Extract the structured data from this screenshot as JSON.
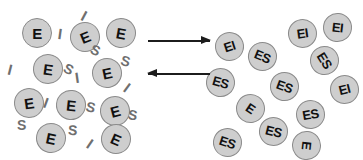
{
  "figure": {
    "background_color": "#ffffff",
    "token_fill_color": "#cecece",
    "token_border_color": "#8a8a8a",
    "token_text_color": "#111111",
    "glyph_color": "#6f6f6f",
    "arrow_color": "#1c1c1c"
  },
  "left_panel": {
    "name": "free-enzyme-pool",
    "tokens": [
      {
        "label": "E",
        "x": 22,
        "y": 18,
        "size": 30,
        "rotation": 0
      },
      {
        "label": "E",
        "x": 70,
        "y": 22,
        "size": 30,
        "rotation": -22
      },
      {
        "label": "E",
        "x": 106,
        "y": 18,
        "size": 30,
        "rotation": 10
      },
      {
        "label": "E",
        "x": 33,
        "y": 54,
        "size": 30,
        "rotation": 8
      },
      {
        "label": "E",
        "x": 92,
        "y": 58,
        "size": 30,
        "rotation": -12
      },
      {
        "label": "E",
        "x": 14,
        "y": 88,
        "size": 30,
        "rotation": -8
      },
      {
        "label": "E",
        "x": 56,
        "y": 90,
        "size": 30,
        "rotation": 6
      },
      {
        "label": "E",
        "x": 100,
        "y": 96,
        "size": 30,
        "rotation": -15
      },
      {
        "label": "E",
        "x": 36,
        "y": 123,
        "size": 30,
        "rotation": 12
      },
      {
        "label": "E",
        "x": 101,
        "y": 124,
        "size": 30,
        "rotation": 24
      }
    ],
    "glyphs": [
      {
        "label": "I",
        "x": 58,
        "y": 26,
        "rotation": 8
      },
      {
        "label": "I",
        "x": 82,
        "y": 8,
        "rotation": 28
      },
      {
        "label": "S",
        "x": 91,
        "y": 43,
        "rotation": 24
      },
      {
        "label": "S",
        "x": 121,
        "y": 54,
        "rotation": 16
      },
      {
        "label": "I",
        "x": 8,
        "y": 62,
        "rotation": 14
      },
      {
        "label": "S",
        "x": 64,
        "y": 62,
        "rotation": 28
      },
      {
        "label": "I",
        "x": 75,
        "y": 70,
        "rotation": -8
      },
      {
        "label": "I",
        "x": 125,
        "y": 80,
        "rotation": 36
      },
      {
        "label": "I",
        "x": 44,
        "y": 95,
        "rotation": 20
      },
      {
        "label": "S",
        "x": 86,
        "y": 100,
        "rotation": 14
      },
      {
        "label": "S",
        "x": 128,
        "y": 108,
        "rotation": 10
      },
      {
        "label": "S",
        "x": 17,
        "y": 118,
        "rotation": 0
      },
      {
        "label": "S",
        "x": 68,
        "y": 123,
        "rotation": 4
      },
      {
        "label": "I",
        "x": 88,
        "y": 136,
        "rotation": 34
      }
    ]
  },
  "arrows": [
    {
      "name": "forward-arrow",
      "direction": "right",
      "x": 148,
      "y": 40,
      "width": 62,
      "label": ""
    },
    {
      "name": "reverse-arrow",
      "direction": "left",
      "x": 148,
      "y": 73,
      "width": 62,
      "label": ""
    }
  ],
  "right_panel": {
    "name": "bound-complex-pool",
    "tokens": [
      {
        "label": "EI",
        "x": 215,
        "y": 32,
        "size": 29,
        "rotation": -18
      },
      {
        "label": "ES",
        "x": 248,
        "y": 42,
        "size": 29,
        "rotation": 22
      },
      {
        "label": "EI",
        "x": 288,
        "y": 19,
        "size": 29,
        "rotation": -8
      },
      {
        "label": "EI",
        "x": 323,
        "y": 13,
        "size": 29,
        "rotation": 6
      },
      {
        "label": "ES",
        "x": 310,
        "y": 46,
        "size": 29,
        "rotation": 58
      },
      {
        "label": "ES",
        "x": 206,
        "y": 68,
        "size": 29,
        "rotation": 16
      },
      {
        "label": "ES",
        "x": 270,
        "y": 72,
        "size": 29,
        "rotation": 20
      },
      {
        "label": "EI",
        "x": 330,
        "y": 75,
        "size": 29,
        "rotation": -14
      },
      {
        "label": "E",
        "x": 236,
        "y": 94,
        "size": 29,
        "rotation": 34
      },
      {
        "label": "ES",
        "x": 296,
        "y": 100,
        "size": 29,
        "rotation": -10
      },
      {
        "label": "ES",
        "x": 259,
        "y": 117,
        "size": 29,
        "rotation": 14
      },
      {
        "label": "ES",
        "x": 213,
        "y": 128,
        "size": 29,
        "rotation": 18
      },
      {
        "label": "E",
        "x": 292,
        "y": 131,
        "size": 29,
        "rotation": 96
      }
    ],
    "glyphs": []
  }
}
